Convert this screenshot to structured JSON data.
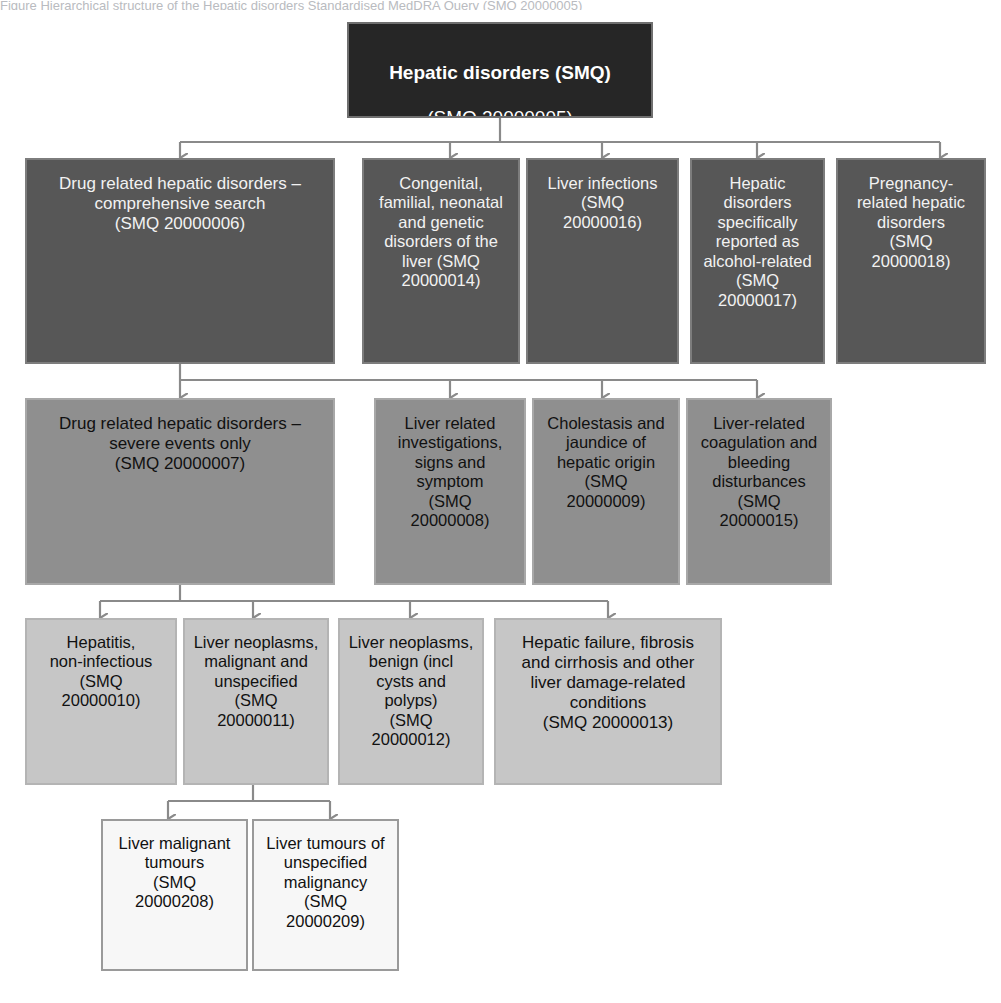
{
  "figure": {
    "cropped_caption_fragment": "Figure  Hierarchical structure of the Hepatic disorders Standardised MedDRA Query (SMQ 20000005)",
    "colors": {
      "level0_fill": "#262626",
      "level1_fill": "#575757",
      "level2_fill": "#8f8f8f",
      "level3_fill": "#c6c6c6",
      "level4_fill": "#f7f7f7",
      "connector": "#8a8a8a",
      "light_text": "#f2f2f2",
      "dark_text": "#111111"
    }
  },
  "nodes": {
    "root": {
      "title": "Hepatic disorders (SMQ)",
      "code": "(SMQ 20000005)"
    },
    "level1": [
      {
        "label": "Drug related hepatic disorders –\ncomprehensive search\n(SMQ 20000006)"
      },
      {
        "label": "Congenital,\nfamilial, neonatal\nand genetic\ndisorders of the\nliver (SMQ\n20000014)"
      },
      {
        "label": "Liver infections\n(SMQ\n20000016)"
      },
      {
        "label": "Hepatic\ndisorders\nspecifically\nreported as\nalcohol-related\n(SMQ\n20000017)"
      },
      {
        "label": "Pregnancy-\nrelated hepatic\ndisorders\n(SMQ\n20000018)"
      }
    ],
    "level2": [
      {
        "label": "Drug related hepatic disorders –\nsevere events only\n(SMQ 20000007)"
      },
      {
        "label": "Liver related\ninvestigations,\nsigns and\nsymptom\n(SMQ\n20000008)"
      },
      {
        "label": "Cholestasis and\njaundice of\nhepatic origin\n(SMQ\n20000009)"
      },
      {
        "label": "Liver-related\ncoagulation and\nbleeding\ndisturbances\n(SMQ\n20000015)"
      }
    ],
    "level3": [
      {
        "label": "Hepatitis,\nnon-infectious\n(SMQ\n20000010)"
      },
      {
        "label": "Liver neoplasms,\nmalignant and\nunspecified\n(SMQ\n20000011)"
      },
      {
        "label": "Liver neoplasms,\nbenign (incl\ncysts and\npolyps)\n(SMQ\n20000012)"
      },
      {
        "label": "Hepatic failure, fibrosis\nand cirrhosis and other\nliver damage-related\nconditions\n(SMQ 20000013)"
      }
    ],
    "level4": [
      {
        "label": "Liver malignant\ntumours\n(SMQ\n20000208)"
      },
      {
        "label": "Liver tumours of\nunspecified\nmalignancy\n(SMQ\n20000209)"
      }
    ]
  }
}
